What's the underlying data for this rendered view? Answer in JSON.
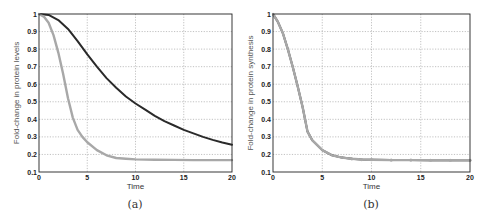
{
  "chart_data": [
    {
      "type": "line",
      "panel": "(a)",
      "title": "",
      "xlabel": "Time",
      "ylabel": "Fold-change in protein levels",
      "xlim": [
        0,
        20
      ],
      "ylim": [
        0.1,
        1
      ],
      "xticks": [
        "0",
        "5",
        "10",
        "15",
        "20"
      ],
      "yticks": [
        "0.1",
        "0.2",
        "0.3",
        "0.4",
        "0.5",
        "0.6",
        "0.7",
        "0.8",
        "0.9",
        "1"
      ],
      "grid": true,
      "legend": null,
      "series": [
        {
          "name": "dark curve",
          "color": "#2a2a2a",
          "x": [
            0,
            1,
            2,
            3,
            4,
            5,
            6,
            7,
            8,
            9,
            10,
            11,
            12,
            13,
            14,
            15,
            16,
            17,
            18,
            19,
            20
          ],
          "y": [
            1.0,
            0.995,
            0.965,
            0.915,
            0.845,
            0.77,
            0.7,
            0.635,
            0.58,
            0.53,
            0.49,
            0.455,
            0.42,
            0.39,
            0.365,
            0.34,
            0.32,
            0.3,
            0.283,
            0.268,
            0.255
          ]
        },
        {
          "name": "light curve",
          "color": "#a8a8a8",
          "x": [
            0,
            0.5,
            1,
            1.5,
            2,
            2.5,
            3,
            3.5,
            4,
            4.5,
            5,
            6,
            7,
            8,
            9,
            10,
            12,
            14,
            16,
            18,
            20
          ],
          "y": [
            1.0,
            0.985,
            0.95,
            0.88,
            0.78,
            0.66,
            0.52,
            0.41,
            0.34,
            0.3,
            0.27,
            0.225,
            0.195,
            0.18,
            0.175,
            0.172,
            0.17,
            0.169,
            0.168,
            0.168,
            0.168
          ]
        }
      ]
    },
    {
      "type": "line",
      "panel": "(b)",
      "title": "",
      "xlabel": "Time",
      "ylabel": "Fold-change in protein synthesis",
      "xlim": [
        0,
        20
      ],
      "ylim": [
        0.1,
        1
      ],
      "xticks": [
        "0",
        "5",
        "10",
        "15",
        "20"
      ],
      "yticks": [
        "0.1",
        "0.2",
        "0.3",
        "0.4",
        "0.5",
        "0.6",
        "0.7",
        "0.8",
        "0.9",
        "1"
      ],
      "grid": true,
      "legend": null,
      "series": [
        {
          "name": "dark curve",
          "color": "#2a2a2a",
          "x": [
            0,
            0.5,
            1,
            1.5,
            2,
            2.5,
            3,
            3.5,
            4,
            5,
            6,
            7,
            8,
            9,
            10,
            12,
            14,
            16,
            18,
            20
          ],
          "y": [
            1.0,
            0.955,
            0.89,
            0.8,
            0.7,
            0.59,
            0.47,
            0.33,
            0.28,
            0.225,
            0.195,
            0.182,
            0.175,
            0.171,
            0.17,
            0.168,
            0.168,
            0.167,
            0.167,
            0.167
          ]
        },
        {
          "name": "light marked curve",
          "color": "#a8a8a8",
          "x": [
            0,
            0.5,
            1,
            1.5,
            2,
            2.5,
            3,
            3.5,
            4,
            5,
            6,
            7,
            8,
            9,
            10,
            12,
            14,
            16,
            18,
            20
          ],
          "y": [
            1.0,
            0.955,
            0.89,
            0.8,
            0.7,
            0.59,
            0.47,
            0.33,
            0.28,
            0.225,
            0.195,
            0.182,
            0.175,
            0.171,
            0.17,
            0.168,
            0.168,
            0.167,
            0.167,
            0.167
          ]
        }
      ]
    }
  ],
  "captions": {
    "a": "(a)",
    "b": "(b)"
  }
}
